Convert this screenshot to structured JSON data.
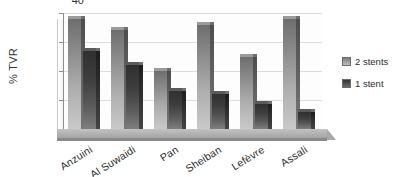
{
  "chart_data": {
    "type": "bar",
    "title": "",
    "subtitle": "",
    "xlabel": "",
    "ylabel": "% TVR",
    "ylim": [
      0,
      40
    ],
    "yticks": [
      0,
      10,
      20,
      30,
      40
    ],
    "ytick_labels": [
      "0",
      "10",
      "20",
      "30",
      "40"
    ],
    "grid": true,
    "grid_axis": "y",
    "legend_position": "right",
    "orientation": "vertical",
    "grouping": "grouped",
    "style_3d": true,
    "categories": [
      "Anzuini",
      "Al Suwaidi",
      "Pan",
      "Sheiban",
      "Lefèvre",
      "Assali"
    ],
    "series": [
      {
        "name": "2 stents",
        "color": "#9b9b9b",
        "values": [
          38,
          34,
          20,
          36,
          25,
          38
        ]
      },
      {
        "name": "1 stent",
        "color": "#3d3d3d",
        "values": [
          27,
          22,
          13,
          12,
          8.5,
          6
        ]
      }
    ]
  },
  "axis": {
    "y_title": "% TVR",
    "ticks": [
      {
        "label": "40",
        "value": 40
      },
      {
        "label": "30",
        "value": 30
      },
      {
        "label": "20",
        "value": 20
      },
      {
        "label": "10",
        "value": 10
      },
      {
        "label": "0",
        "value": 0
      }
    ]
  },
  "legend": {
    "items": [
      {
        "label": "2 stents",
        "swatch": "legend-swatch-2-stents"
      },
      {
        "label": "1 stent",
        "swatch": "legend-swatch-1-stent"
      }
    ]
  }
}
